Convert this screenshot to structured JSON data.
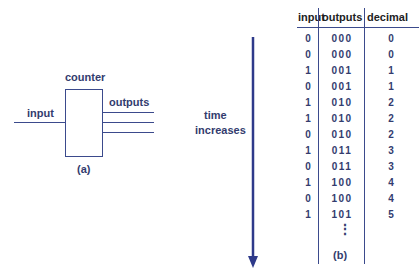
{
  "panel_a": {
    "block_label": "counter",
    "input_label": "input",
    "outputs_label": "outputs",
    "caption": "(a)"
  },
  "arrow": {
    "label_line1": "time",
    "label_line2": "increases"
  },
  "panel_b": {
    "headers": [
      "input",
      "outputs",
      "decimal"
    ],
    "rows": [
      {
        "input": "0",
        "outputs": "000",
        "decimal": "0"
      },
      {
        "input": "0",
        "outputs": "000",
        "decimal": "0"
      },
      {
        "input": "1",
        "outputs": "001",
        "decimal": "1"
      },
      {
        "input": "0",
        "outputs": "001",
        "decimal": "1"
      },
      {
        "input": "1",
        "outputs": "010",
        "decimal": "2"
      },
      {
        "input": "1",
        "outputs": "010",
        "decimal": "2"
      },
      {
        "input": "0",
        "outputs": "010",
        "decimal": "2"
      },
      {
        "input": "1",
        "outputs": "011",
        "decimal": "3"
      },
      {
        "input": "0",
        "outputs": "011",
        "decimal": "3"
      },
      {
        "input": "1",
        "outputs": "100",
        "decimal": "4"
      },
      {
        "input": "0",
        "outputs": "100",
        "decimal": "4"
      },
      {
        "input": "1",
        "outputs": "101",
        "decimal": "5"
      }
    ],
    "ellipsis": "⋮",
    "caption": "(b)"
  },
  "colors": {
    "line": "#3b4a8c",
    "text": "#333c6e"
  }
}
